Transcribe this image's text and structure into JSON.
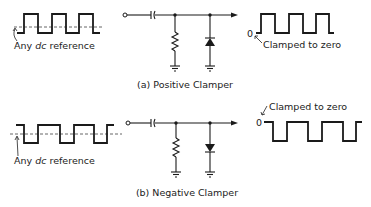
{
  "figure": {
    "positive": {
      "caption": "(a) Positive Clamper",
      "input_label_prefix": "Any ",
      "input_label_italic": "dc",
      "input_label_suffix": " reference",
      "output_label": "Clamped to zero",
      "zero_label": "0"
    },
    "negative": {
      "caption": "(b) Negative Clamper",
      "input_label_prefix": "Any ",
      "input_label_italic": "dc",
      "input_label_suffix": " reference",
      "output_label": "Clamped to zero",
      "zero_label": "0"
    }
  }
}
